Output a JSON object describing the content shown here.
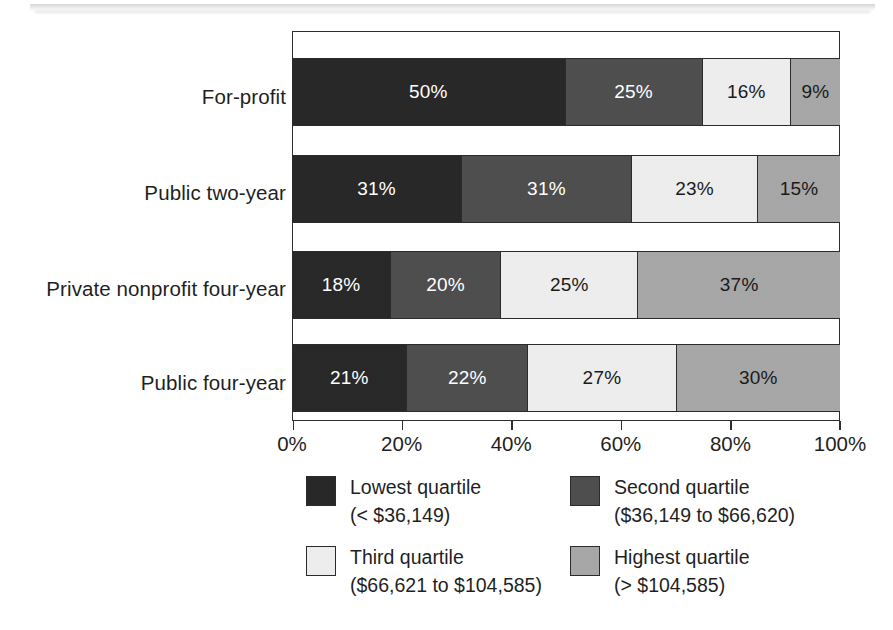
{
  "chart_data": {
    "type": "bar",
    "subtype": "100% stacked horizontal bar",
    "title": "",
    "xlabel": "",
    "ylabel": "",
    "xlim": [
      0,
      100
    ],
    "grid": false,
    "legend_position": "bottom",
    "categories": [
      "For-profit",
      "Public two-year",
      "Private nonprofit four-year",
      "Public four-year"
    ],
    "series": [
      {
        "name": "Lowest quartile",
        "range": "(< $36,149)",
        "color": "#262626",
        "values": [
          50,
          25,
          18,
          21
        ],
        "labels": [
          "50%",
          "31%",
          "18%",
          "21%"
        ]
      },
      {
        "name": "Second quartile",
        "range": "($36,149 to $66,620)",
        "color": "#4d4d4d",
        "values": [
          25,
          31,
          20,
          22
        ],
        "labels": [
          "25%",
          "31%",
          "20%",
          "22%"
        ]
      },
      {
        "name": "Third quartile",
        "range": "($66,621 to $104,585)",
        "color": "#f0f0f0",
        "values": [
          16,
          23,
          25,
          27
        ],
        "labels": [
          "16%",
          "23%",
          "25%",
          "27%"
        ]
      },
      {
        "name": "Highest quartile",
        "range": "(> $104,585)",
        "color": "#a8a8a8",
        "values": [
          9,
          15,
          37,
          30
        ],
        "labels": [
          "9%",
          "15%",
          "37%",
          "30%"
        ]
      }
    ],
    "rows": [
      {
        "category": "For-profit",
        "segments": [
          {
            "label": "50%",
            "value": 50,
            "quartile": "Lowest quartile",
            "color": "#262626",
            "text_color": "#ffffff"
          },
          {
            "label": "25%",
            "value": 25,
            "quartile": "Second quartile",
            "color": "#4d4d4d",
            "text_color": "#ffffff"
          },
          {
            "label": "16%",
            "value": 16,
            "quartile": "Third quartile",
            "color": "#f0f0f0",
            "text_color": "#1a1a1a"
          },
          {
            "label": "9%",
            "value": 9,
            "quartile": "Highest quartile",
            "color": "#a8a8a8",
            "text_color": "#1a1a1a"
          }
        ]
      },
      {
        "category": "Public two-year",
        "segments": [
          {
            "label": "31%",
            "value": 31,
            "quartile": "Lowest quartile",
            "color": "#262626",
            "text_color": "#ffffff"
          },
          {
            "label": "31%",
            "value": 31,
            "quartile": "Second quartile",
            "color": "#4d4d4d",
            "text_color": "#ffffff"
          },
          {
            "label": "23%",
            "value": 23,
            "quartile": "Third quartile",
            "color": "#f0f0f0",
            "text_color": "#1a1a1a"
          },
          {
            "label": "15%",
            "value": 15,
            "quartile": "Highest quartile",
            "color": "#a8a8a8",
            "text_color": "#1a1a1a"
          }
        ]
      },
      {
        "category": "Private nonprofit four-year",
        "segments": [
          {
            "label": "18%",
            "value": 18,
            "quartile": "Lowest quartile",
            "color": "#262626",
            "text_color": "#ffffff"
          },
          {
            "label": "20%",
            "value": 20,
            "quartile": "Second quartile",
            "color": "#4d4d4d",
            "text_color": "#ffffff"
          },
          {
            "label": "25%",
            "value": 25,
            "quartile": "Third quartile",
            "color": "#f0f0f0",
            "text_color": "#1a1a1a"
          },
          {
            "label": "37%",
            "value": 37,
            "quartile": "Highest quartile",
            "color": "#a8a8a8",
            "text_color": "#1a1a1a"
          }
        ]
      },
      {
        "category": "Public four-year",
        "segments": [
          {
            "label": "21%",
            "value": 21,
            "quartile": "Lowest quartile",
            "color": "#262626",
            "text_color": "#ffffff"
          },
          {
            "label": "22%",
            "value": 22,
            "quartile": "Second quartile",
            "color": "#4d4d4d",
            "text_color": "#ffffff"
          },
          {
            "label": "27%",
            "value": 27,
            "quartile": "Third quartile",
            "color": "#f0f0f0",
            "text_color": "#1a1a1a"
          },
          {
            "label": "30%",
            "value": 30,
            "quartile": "Highest quartile",
            "color": "#a8a8a8",
            "text_color": "#1a1a1a"
          }
        ]
      }
    ],
    "xticks": [
      {
        "value": 0,
        "label": "0%"
      },
      {
        "value": 20,
        "label": "20%"
      },
      {
        "value": 40,
        "label": "40%"
      },
      {
        "value": 60,
        "label": "60%"
      },
      {
        "value": 80,
        "label": "80%"
      },
      {
        "value": 100,
        "label": "100%"
      }
    ],
    "legend": [
      {
        "title": "Lowest quartile",
        "range": "(< $36,149)",
        "color": "#262626"
      },
      {
        "title": "Second quartile",
        "range": "($36,149 to $66,620)",
        "color": "#4d4d4d"
      },
      {
        "title": "Third quartile",
        "range": "($66,621 to $104,585)",
        "color": "#f0f0f0"
      },
      {
        "title": "Highest quartile",
        "range": "(> $104,585)",
        "color": "#a8a8a8"
      }
    ]
  }
}
